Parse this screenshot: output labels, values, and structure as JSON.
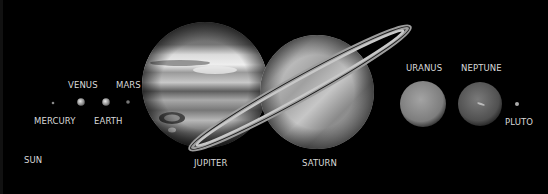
{
  "scene": {
    "title": "Solar System Planets",
    "background": "#000000",
    "bodies": [
      {
        "name": "SUN",
        "label": "SUN"
      },
      {
        "name": "MERCURY",
        "label": "MERCURY"
      },
      {
        "name": "VENUS",
        "label": "VENUS"
      },
      {
        "name": "EARTH",
        "label": "EARTH"
      },
      {
        "name": "MARS",
        "label": "MARS"
      },
      {
        "name": "JUPITER",
        "label": "JUPITER"
      },
      {
        "name": "SATURN",
        "label": "SATURN"
      },
      {
        "name": "URANUS",
        "label": "URANUS"
      },
      {
        "name": "NEPTUNE",
        "label": "NEPTUNE"
      },
      {
        "name": "PLUTO",
        "label": "PLUTO"
      }
    ]
  }
}
